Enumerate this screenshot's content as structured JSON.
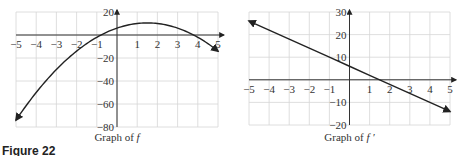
{
  "chart_data": [
    {
      "type": "line",
      "title": "Graph of f",
      "caption_prefix": "Graph of ",
      "caption_var": "f",
      "xlabel": "",
      "ylabel": "",
      "xlim": [
        -5,
        5
      ],
      "ylim": [
        -80,
        20
      ],
      "grid": true,
      "x_ticks": [
        "−5",
        "−4",
        "−3",
        "−2",
        "−1",
        "1",
        "2",
        "3",
        "4",
        "5"
      ],
      "y_ticks": [
        "20",
        "−20",
        "−40",
        "−60",
        "−80"
      ],
      "series": [
        {
          "name": "f(x) = 6 + 6x − 2x²",
          "x": [
            -5,
            -4,
            -3,
            -2,
            -1,
            0,
            1,
            1.5,
            2,
            3,
            4,
            5
          ],
          "y": [
            -74,
            -50,
            -30,
            -14,
            -2,
            6,
            10,
            10.5,
            10,
            6,
            -2,
            -14
          ]
        }
      ]
    },
    {
      "type": "line",
      "title": "Graph of f′",
      "caption_prefix": "Graph of ",
      "caption_var": "f ′",
      "xlabel": "",
      "ylabel": "",
      "xlim": [
        -5,
        5
      ],
      "ylim": [
        -20,
        30
      ],
      "grid": true,
      "x_ticks": [
        "−5",
        "−4",
        "−3",
        "−2",
        "−1",
        "1",
        "2",
        "3",
        "4",
        "5"
      ],
      "y_ticks": [
        "30",
        "20",
        "10",
        "−10",
        "−20"
      ],
      "series": [
        {
          "name": "f′(x) = 6 − 4x",
          "x": [
            -5,
            -4,
            -3,
            -2,
            -1,
            0,
            1,
            1.5,
            2,
            3,
            4,
            5
          ],
          "y": [
            26,
            22,
            18,
            14,
            10,
            6,
            2,
            0,
            -2,
            -6,
            -10,
            -14
          ]
        }
      ]
    }
  ],
  "figure_label": "Figure 22"
}
